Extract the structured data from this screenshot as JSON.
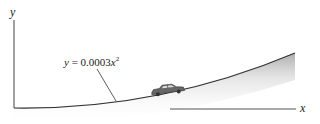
{
  "diagram": {
    "axes": {
      "y_label": "y",
      "x_label": "x"
    },
    "curve": {
      "equation_prefix": "y = 0.0003",
      "equation_var": "x",
      "equation_exp": "2",
      "equation_full": "y = 0.0003x^2"
    },
    "object": {
      "name": "car"
    },
    "colors": {
      "line": "#333333",
      "shade": "#bdbdbd",
      "background": "#ffffff"
    }
  }
}
